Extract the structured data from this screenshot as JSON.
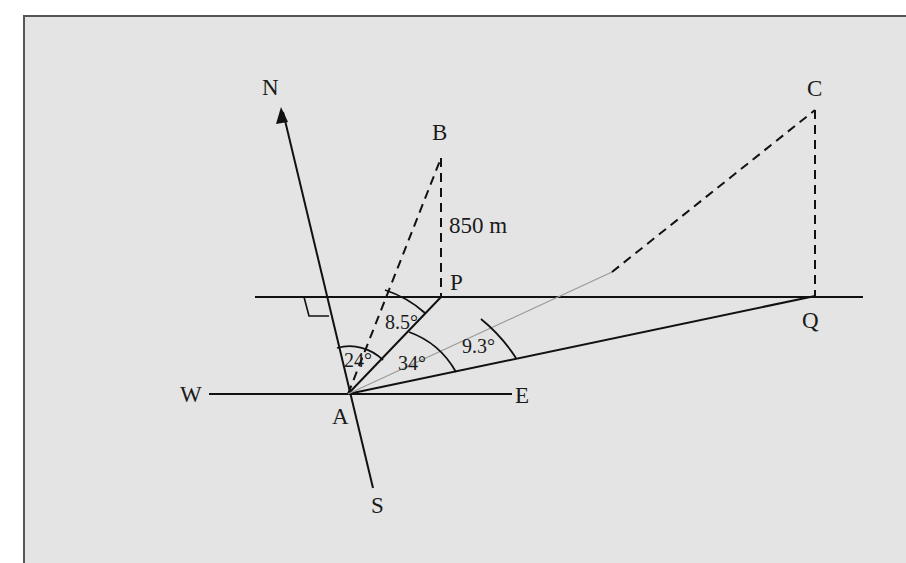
{
  "diagram": {
    "title": "",
    "colors": {
      "background": "#e4e4e4",
      "frame_border": "#555555",
      "line": "#111111",
      "faint_line": "#9a9a9a"
    },
    "points": {
      "N": "N",
      "S": "S",
      "W": "W",
      "E": "E",
      "A": "A",
      "B": "B",
      "C": "C",
      "P": "P",
      "Q": "Q"
    },
    "measurements": {
      "height_BP": "850 m"
    },
    "angles": {
      "bearing_AP_from_N": "24°",
      "elevation_B_from_A": "8.5°",
      "angle_PAQ": "34°",
      "elevation_C_from_A": "9.3°"
    },
    "markers": {
      "right_angle": "right-angle between N-S line and horizontal PQ line"
    }
  }
}
